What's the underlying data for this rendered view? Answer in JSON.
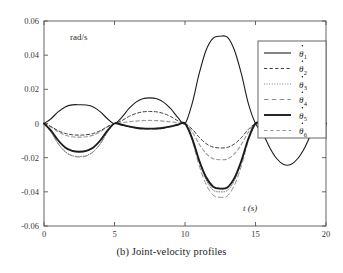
{
  "chart_data": {
    "type": "line",
    "title": "",
    "caption": "(b) Joint-velocity profiles",
    "xlabel": "t (s)",
    "ylabel": "",
    "yunit": "rad/s",
    "xlim": [
      0,
      20
    ],
    "ylim": [
      -0.06,
      0.06
    ],
    "xticks": [
      "0",
      "5",
      "10",
      "15",
      "20"
    ],
    "xtick_values": [
      0,
      5,
      10,
      15,
      20
    ],
    "yticks": [
      "0.06",
      "0.04",
      "0.02",
      "0",
      "-0.02",
      "-0.04",
      "-0.06"
    ],
    "ytick_values": [
      0.06,
      0.04,
      0.02,
      0,
      -0.02,
      -0.04,
      -0.06
    ],
    "grid": false,
    "legend_position": "upper-right",
    "x": [
      0,
      0.5,
      1,
      1.5,
      2,
      2.5,
      3,
      3.5,
      4,
      4.5,
      5,
      5.5,
      6,
      6.5,
      7,
      7.5,
      8,
      8.5,
      9,
      9.5,
      10,
      10.5,
      11,
      11.5,
      12,
      12.5,
      13,
      13.5,
      14,
      14.5,
      15,
      15.5,
      16,
      16.5,
      17,
      17.5,
      18,
      18.5,
      19,
      19.5,
      20
    ],
    "series": [
      {
        "name": "theta-dot-1",
        "label": "θ̇₁",
        "base": "θ",
        "sub": "1",
        "style": "solid",
        "width": 1.1,
        "color": "#1c1c1c",
        "values": [
          0,
          0.0028,
          0.0068,
          0.0097,
          0.0109,
          0.011,
          0.0108,
          0.0097,
          0.0068,
          0.0028,
          0,
          0.0035,
          0.0085,
          0.0124,
          0.0145,
          0.015,
          0.0145,
          0.0124,
          0.0085,
          0.0035,
          0,
          0.0115,
          0.029,
          0.043,
          0.05,
          0.0511,
          0.0505,
          0.043,
          0.029,
          0.0115,
          0,
          -0.0055,
          -0.014,
          -0.0205,
          -0.024,
          -0.024,
          -0.0205,
          -0.014,
          -0.0055,
          -0.001,
          0
        ]
      },
      {
        "name": "theta-dot-2",
        "label": "θ̇₂",
        "base": "θ",
        "sub": "2",
        "style": "dashed",
        "width": 1.0,
        "color": "#3d3d3d",
        "values": [
          0,
          -0.0018,
          -0.0042,
          -0.0058,
          -0.0066,
          -0.0068,
          -0.0066,
          -0.0058,
          -0.0042,
          -0.0018,
          0,
          0.0016,
          0.004,
          0.0058,
          0.0068,
          0.007,
          0.0068,
          0.0058,
          0.004,
          0.0016,
          0,
          -0.0032,
          -0.008,
          -0.0118,
          -0.0138,
          -0.0143,
          -0.014,
          -0.012,
          -0.0082,
          -0.0034,
          0,
          0,
          0,
          0,
          0,
          0,
          0,
          0,
          0,
          0,
          0
        ]
      },
      {
        "name": "theta-dot-3",
        "label": "θ̇₃",
        "base": "θ",
        "sub": "3",
        "style": "dotted",
        "width": 1.0,
        "color": "#707070",
        "values": [
          0,
          -0.005,
          -0.0118,
          -0.0165,
          -0.0188,
          -0.0193,
          -0.0188,
          -0.0165,
          -0.0118,
          -0.005,
          0,
          -0.0007,
          -0.0017,
          -0.0025,
          -0.0029,
          -0.003,
          -0.0029,
          -0.0025,
          -0.0017,
          -0.0007,
          0,
          -0.009,
          -0.0225,
          -0.033,
          -0.039,
          -0.04,
          -0.0392,
          -0.0335,
          -0.0228,
          -0.0092,
          0,
          0,
          0,
          0,
          0,
          0,
          0,
          0,
          0,
          0,
          0
        ]
      },
      {
        "name": "theta-dot-4",
        "label": "θ̇₄",
        "base": "θ",
        "sub": "4",
        "style": "longdash",
        "width": 1.0,
        "color": "#8e8e8e",
        "values": [
          0,
          -0.005,
          -0.0118,
          -0.0165,
          -0.019,
          -0.0196,
          -0.019,
          -0.0165,
          -0.0118,
          -0.005,
          0,
          -0.0008,
          -0.0019,
          -0.0028,
          -0.0032,
          -0.0034,
          -0.0032,
          -0.0028,
          -0.0019,
          -0.0008,
          0,
          -0.0098,
          -0.0245,
          -0.0358,
          -0.042,
          -0.0432,
          -0.0424,
          -0.0362,
          -0.0248,
          -0.01,
          0,
          0,
          0,
          0,
          0,
          0,
          0,
          0,
          0,
          0,
          0
        ]
      },
      {
        "name": "theta-dot-5",
        "label": "θ̇₅",
        "base": "θ",
        "sub": "5",
        "style": "solid",
        "width": 1.9,
        "color": "#1c1c1c",
        "values": [
          0,
          -0.0042,
          -0.0098,
          -0.014,
          -0.016,
          -0.0165,
          -0.016,
          -0.014,
          -0.0098,
          -0.0042,
          0,
          -0.0007,
          -0.0017,
          -0.0025,
          -0.0029,
          -0.003,
          -0.0029,
          -0.0025,
          -0.0017,
          -0.0007,
          0,
          -0.0086,
          -0.0215,
          -0.0315,
          -0.037,
          -0.0381,
          -0.0374,
          -0.032,
          -0.0218,
          -0.0088,
          0,
          0,
          0,
          0,
          0,
          0,
          0,
          0,
          0,
          0,
          0
        ]
      },
      {
        "name": "theta-dot-6",
        "label": "θ̇₆",
        "base": "θ",
        "sub": "6",
        "style": "dashed",
        "width": 1.1,
        "color": "#9a9a9a",
        "values": [
          0,
          -0.002,
          -0.0048,
          -0.0068,
          -0.0078,
          -0.008,
          -0.0078,
          -0.0068,
          -0.0048,
          -0.002,
          0,
          0.0004,
          0.001,
          0.0014,
          0.0017,
          0.0018,
          0.0017,
          0.0014,
          0.001,
          0.0004,
          0,
          -0.0048,
          -0.012,
          -0.0176,
          -0.0206,
          -0.0212,
          -0.0208,
          -0.0178,
          -0.0122,
          -0.005,
          0,
          0,
          0,
          0,
          0,
          0,
          0,
          0,
          0,
          0,
          0
        ]
      }
    ],
    "legend_entries": [
      {
        "name": "legend-theta-dot-1",
        "base": "θ",
        "sub": "1",
        "style": "solid",
        "width": 1.1,
        "color": "#1c1c1c"
      },
      {
        "name": "legend-theta-dot-2",
        "base": "θ",
        "sub": "2",
        "style": "dashed",
        "width": 1.0,
        "color": "#3d3d3d"
      },
      {
        "name": "legend-theta-dot-3",
        "base": "θ",
        "sub": "3",
        "style": "dotted",
        "width": 1.0,
        "color": "#707070"
      },
      {
        "name": "legend-theta-dot-4",
        "base": "θ",
        "sub": "4",
        "style": "longdash",
        "width": 1.0,
        "color": "#8e8e8e"
      },
      {
        "name": "legend-theta-dot-5",
        "base": "θ",
        "sub": "5",
        "style": "solid",
        "width": 1.9,
        "color": "#1c1c1c"
      },
      {
        "name": "legend-theta-dot-6",
        "base": "θ",
        "sub": "6",
        "style": "dashed",
        "width": 1.1,
        "color": "#9a9a9a"
      }
    ],
    "colors": {
      "axis": "#555555",
      "text": "#2b2b2b",
      "background": "#ffffff",
      "legend_border": "#555555"
    }
  }
}
